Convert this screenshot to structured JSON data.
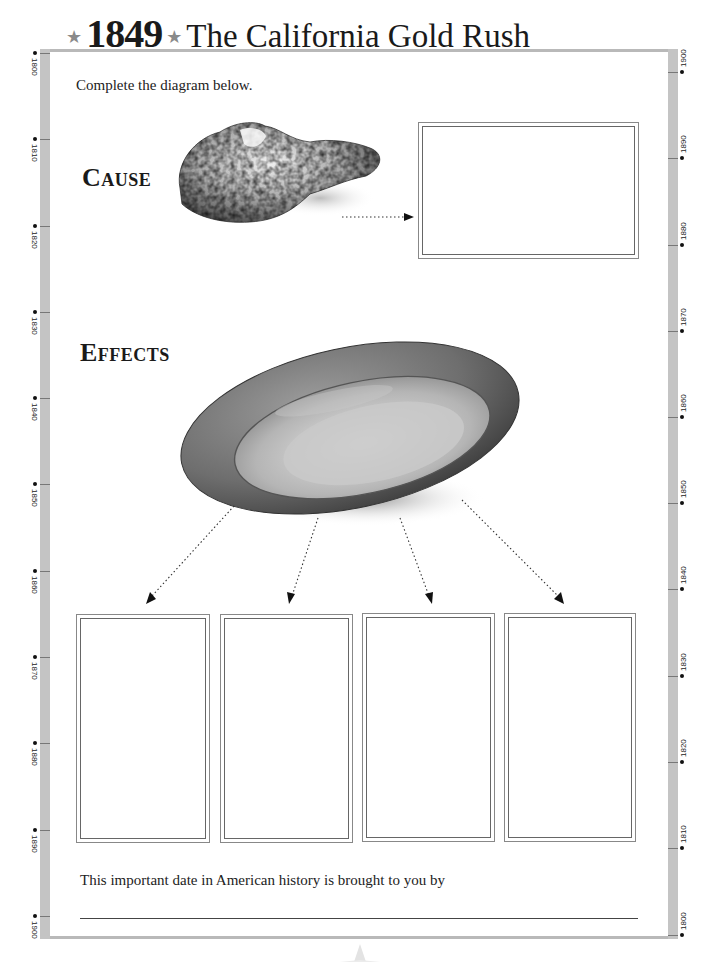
{
  "title": {
    "year": "1849",
    "star_glyph": "★",
    "text": "The California Gold Rush"
  },
  "instructions": "Complete the diagram below.",
  "diagram": {
    "cause": {
      "label": "Cause",
      "image": "gold-nugget-illustration",
      "answer_box": {
        "value": ""
      }
    },
    "effects": {
      "label": "Effects",
      "image": "gold-pan-illustration",
      "answer_boxes": [
        {
          "value": ""
        },
        {
          "value": ""
        },
        {
          "value": ""
        },
        {
          "value": ""
        }
      ]
    }
  },
  "footer": {
    "text": "This important date in American history is brought to you by",
    "signature_value": ""
  },
  "timeline": {
    "left": [
      "1800",
      "1810",
      "1820",
      "1830",
      "1840",
      "1850",
      "1860",
      "1870",
      "1880",
      "1890",
      "1900"
    ],
    "right": [
      "1900",
      "1890",
      "1880",
      "1870",
      "1860",
      "1850",
      "1840",
      "1830",
      "1820",
      "1810",
      "1800"
    ]
  },
  "colors": {
    "frame": "#c4c4c4",
    "ink": "#1a1a1a",
    "star": "#8a8a8a",
    "box_border": "#777777"
  }
}
